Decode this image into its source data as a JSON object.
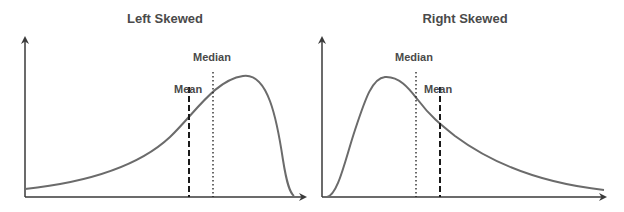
{
  "panels": [
    {
      "title": "Left Skewed",
      "mean_label": "Mean",
      "median_label": "Median",
      "skew": "left"
    },
    {
      "title": "Right Skewed",
      "median_label": "Median",
      "mean_label": "Mean",
      "skew": "right"
    }
  ],
  "colors": {
    "curve": "#6b6b6b",
    "axis": "#3a3a3a",
    "marker": "#1a1a1a",
    "text": "#4a4a4a"
  },
  "legend": {
    "mean_style": "dashed",
    "median_style": "dotted"
  }
}
